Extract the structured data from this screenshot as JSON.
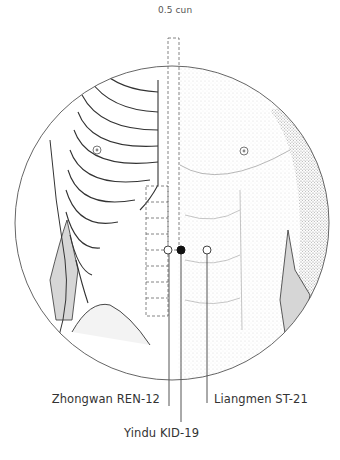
{
  "figure": {
    "measure_label": "0.5 cun",
    "points": [
      {
        "id": "zhongwan",
        "label": "Zhongwan REN-12",
        "style": "open",
        "x": 168,
        "y": 250
      },
      {
        "id": "yindu",
        "label": "Yindu KID-19",
        "style": "filled",
        "x": 181,
        "y": 250
      },
      {
        "id": "liangmen",
        "label": "Liangmen ST-21",
        "style": "open",
        "x": 207,
        "y": 250
      }
    ],
    "colors": {
      "line": "#555555",
      "outline": "#333333",
      "shade": "#d6d6d6",
      "text": "#333333"
    }
  }
}
